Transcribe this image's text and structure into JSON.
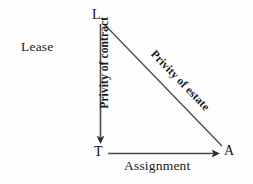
{
  "diagram": {
    "background_color": "#fdfdfd",
    "stroke_color": "#3a3a3a",
    "text_color": "#1a1a1a",
    "vertices": [
      {
        "id": "L",
        "label": "L",
        "role": "landlord",
        "x": 100,
        "y": 18
      },
      {
        "id": "T",
        "label": "T",
        "role": "tenant",
        "x": 100,
        "y": 153
      },
      {
        "id": "A",
        "label": "A",
        "role": "assignee",
        "x": 226,
        "y": 153
      }
    ],
    "edges": [
      {
        "id": "lease",
        "label": "Lease",
        "from": "",
        "to": "",
        "style": "plain-text",
        "weight": "regular"
      },
      {
        "id": "privity-of-contract",
        "label": "Privity of contract",
        "from": "L",
        "to": "T",
        "orientation": "vertical",
        "arrow": "end",
        "weight": "bold",
        "rotation_deg": -90
      },
      {
        "id": "privity-of-estate",
        "label": "Privity of estate",
        "from": "L",
        "to": "A",
        "orientation": "diagonal",
        "arrow": "none",
        "weight": "bold",
        "rotation_deg": 46
      },
      {
        "id": "assignment",
        "label": "Assignment",
        "from": "T",
        "to": "A",
        "orientation": "horizontal",
        "arrow": "end",
        "weight": "regular",
        "rotation_deg": 0
      }
    ]
  }
}
